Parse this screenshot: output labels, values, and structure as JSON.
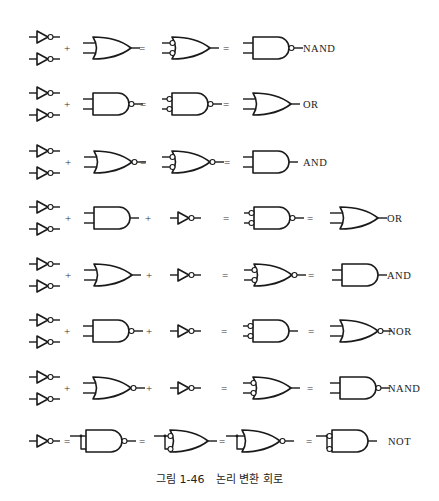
{
  "figure": {
    "caption_number": "그림 1-46",
    "caption_title": "논리 변환 회로"
  },
  "rows": [
    {
      "y": 48,
      "items": [
        {
          "kind": "inv_pair",
          "x": 29
        },
        {
          "kind": "op",
          "x": 67,
          "text": "+"
        },
        {
          "kind": "gate",
          "x": 83,
          "type": "OR",
          "in_bubbles": false,
          "out_bubble": false
        },
        {
          "kind": "op",
          "x": 142,
          "text": "="
        },
        {
          "kind": "gate",
          "x": 162,
          "type": "OR",
          "in_bubbles": true,
          "out_bubble": false
        },
        {
          "kind": "op",
          "x": 226,
          "text": "="
        },
        {
          "kind": "gate",
          "x": 243,
          "type": "AND",
          "in_bubbles": false,
          "out_bubble": true
        },
        {
          "kind": "label",
          "x": 303,
          "text": "NAND"
        }
      ]
    },
    {
      "y": 104,
      "items": [
        {
          "kind": "inv_pair",
          "x": 29
        },
        {
          "kind": "op",
          "x": 67,
          "text": "+"
        },
        {
          "kind": "gate",
          "x": 83,
          "type": "AND",
          "in_bubbles": false,
          "out_bubble": true
        },
        {
          "kind": "op",
          "x": 143,
          "text": "="
        },
        {
          "kind": "gate",
          "x": 162,
          "type": "AND",
          "in_bubbles": true,
          "out_bubble": true
        },
        {
          "kind": "op",
          "x": 226,
          "text": "="
        },
        {
          "kind": "gate",
          "x": 243,
          "type": "OR",
          "in_bubbles": false,
          "out_bubble": false
        },
        {
          "kind": "label",
          "x": 303,
          "text": "OR"
        }
      ]
    },
    {
      "y": 162,
      "items": [
        {
          "kind": "inv_pair",
          "x": 29
        },
        {
          "kind": "op",
          "x": 68,
          "text": "+"
        },
        {
          "kind": "gate",
          "x": 84,
          "type": "OR",
          "in_bubbles": false,
          "out_bubble": true
        },
        {
          "kind": "op",
          "x": 143,
          "text": "="
        },
        {
          "kind": "gate",
          "x": 162,
          "type": "OR",
          "in_bubbles": true,
          "out_bubble": true
        },
        {
          "kind": "op",
          "x": 227,
          "text": "="
        },
        {
          "kind": "gate",
          "x": 243,
          "type": "AND",
          "in_bubbles": false,
          "out_bubble": false
        },
        {
          "kind": "label",
          "x": 303,
          "text": "AND"
        }
      ]
    },
    {
      "y": 218,
      "items": [
        {
          "kind": "inv_pair",
          "x": 29
        },
        {
          "kind": "op",
          "x": 68,
          "text": "+"
        },
        {
          "kind": "gate",
          "x": 84,
          "type": "AND",
          "in_bubbles": false,
          "out_bubble": false
        },
        {
          "kind": "op",
          "x": 148,
          "text": "+"
        },
        {
          "kind": "inv",
          "x": 170
        },
        {
          "kind": "op",
          "x": 226,
          "text": "="
        },
        {
          "kind": "gate",
          "x": 244,
          "type": "AND",
          "in_bubbles": true,
          "out_bubble": true
        },
        {
          "kind": "op",
          "x": 310,
          "text": "="
        },
        {
          "kind": "gate",
          "x": 330,
          "type": "OR",
          "in_bubbles": false,
          "out_bubble": false
        },
        {
          "kind": "label",
          "x": 387,
          "text": "OR"
        }
      ]
    },
    {
      "y": 275,
      "items": [
        {
          "kind": "inv_pair",
          "x": 29
        },
        {
          "kind": "op",
          "x": 68,
          "text": "+"
        },
        {
          "kind": "gate",
          "x": 84,
          "type": "OR",
          "in_bubbles": false,
          "out_bubble": false
        },
        {
          "kind": "op",
          "x": 149,
          "text": "+"
        },
        {
          "kind": "inv",
          "x": 170
        },
        {
          "kind": "op",
          "x": 225,
          "text": "="
        },
        {
          "kind": "gate",
          "x": 244,
          "type": "OR",
          "in_bubbles": true,
          "out_bubble": true
        },
        {
          "kind": "op",
          "x": 311,
          "text": "="
        },
        {
          "kind": "gate",
          "x": 332,
          "type": "AND",
          "in_bubbles": false,
          "out_bubble": false
        },
        {
          "kind": "label",
          "x": 387,
          "text": "AND"
        }
      ]
    },
    {
      "y": 331,
      "items": [
        {
          "kind": "inv_pair",
          "x": 29
        },
        {
          "kind": "op",
          "x": 67,
          "text": "+"
        },
        {
          "kind": "gate",
          "x": 83,
          "type": "AND",
          "in_bubbles": false,
          "out_bubble": true
        },
        {
          "kind": "op",
          "x": 149,
          "text": "+"
        },
        {
          "kind": "inv",
          "x": 170
        },
        {
          "kind": "op",
          "x": 224,
          "text": "="
        },
        {
          "kind": "gate",
          "x": 243,
          "type": "AND",
          "in_bubbles": true,
          "out_bubble": false
        },
        {
          "kind": "op",
          "x": 311,
          "text": "="
        },
        {
          "kind": "gate",
          "x": 330,
          "type": "OR",
          "in_bubbles": false,
          "out_bubble": true
        },
        {
          "kind": "label",
          "x": 388,
          "text": "NOR"
        }
      ]
    },
    {
      "y": 388,
      "items": [
        {
          "kind": "inv_pair",
          "x": 29
        },
        {
          "kind": "op",
          "x": 67,
          "text": "+"
        },
        {
          "kind": "gate",
          "x": 83,
          "type": "OR",
          "in_bubbles": false,
          "out_bubble": true
        },
        {
          "kind": "op",
          "x": 149,
          "text": "+"
        },
        {
          "kind": "inv",
          "x": 170
        },
        {
          "kind": "op",
          "x": 224,
          "text": "="
        },
        {
          "kind": "gate",
          "x": 243,
          "type": "OR",
          "in_bubbles": true,
          "out_bubble": false
        },
        {
          "kind": "op",
          "x": 310,
          "text": "="
        },
        {
          "kind": "gate",
          "x": 330,
          "type": "AND",
          "in_bubbles": false,
          "out_bubble": true
        },
        {
          "kind": "label",
          "x": 388,
          "text": "NAND"
        }
      ]
    },
    {
      "y": 441,
      "items": [
        {
          "kind": "inv",
          "x": 29
        },
        {
          "kind": "op",
          "x": 67,
          "text": "="
        },
        {
          "kind": "gate",
          "x": 76,
          "type": "AND",
          "in_bubbles": false,
          "out_bubble": true,
          "tied": true
        },
        {
          "kind": "op",
          "x": 142,
          "text": "="
        },
        {
          "kind": "gate",
          "x": 160,
          "type": "OR",
          "in_bubbles": true,
          "out_bubble": false,
          "tied": true
        },
        {
          "kind": "op",
          "x": 222,
          "text": "="
        },
        {
          "kind": "gate",
          "x": 232,
          "type": "OR",
          "in_bubbles": false,
          "out_bubble": true,
          "tied": true
        },
        {
          "kind": "op",
          "x": 309,
          "text": "="
        },
        {
          "kind": "gate",
          "x": 322,
          "type": "AND",
          "in_bubbles": true,
          "out_bubble": false,
          "tied": true
        },
        {
          "kind": "label",
          "x": 388,
          "text": "NOT"
        }
      ]
    }
  ]
}
